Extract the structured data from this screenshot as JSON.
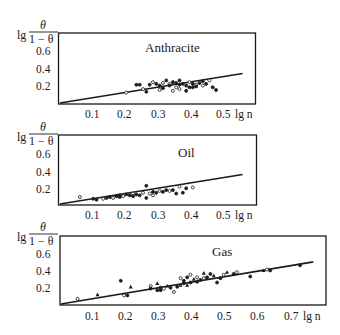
{
  "chart_data": [
    {
      "type": "scatter",
      "title": "Anthracite",
      "xlabel": "lg n",
      "ylabel": "lg θ/(1−θ)",
      "x_ticks": [
        "0.1",
        "0.2",
        "0.3",
        "0.4",
        "0.5"
      ],
      "y_ticks": [
        "0.2",
        "0.4",
        "0.6"
      ],
      "xlim": [
        0,
        0.59
      ],
      "ylim": [
        0,
        0.8
      ],
      "grid": false,
      "fit_line": {
        "x": [
          0,
          0.55
        ],
        "y": [
          0,
          0.34
        ]
      },
      "points": [
        [
          0.2,
          0.12
        ],
        [
          0.23,
          0.21
        ],
        [
          0.24,
          0.21
        ],
        [
          0.25,
          0.16
        ],
        [
          0.26,
          0.13
        ],
        [
          0.27,
          0.21
        ],
        [
          0.28,
          0.24
        ],
        [
          0.29,
          0.22
        ],
        [
          0.3,
          0.2
        ],
        [
          0.31,
          0.23
        ],
        [
          0.31,
          0.17
        ],
        [
          0.32,
          0.26
        ],
        [
          0.33,
          0.22
        ],
        [
          0.33,
          0.2
        ],
        [
          0.34,
          0.24
        ],
        [
          0.35,
          0.18
        ],
        [
          0.35,
          0.23
        ],
        [
          0.36,
          0.21
        ],
        [
          0.36,
          0.16
        ],
        [
          0.37,
          0.22
        ],
        [
          0.38,
          0.2
        ],
        [
          0.39,
          0.24
        ],
        [
          0.39,
          0.18
        ],
        [
          0.4,
          0.22
        ],
        [
          0.41,
          0.21
        ],
        [
          0.41,
          0.19
        ],
        [
          0.42,
          0.23
        ],
        [
          0.43,
          0.2
        ],
        [
          0.43,
          0.25
        ],
        [
          0.44,
          0.22
        ],
        [
          0.45,
          0.26
        ],
        [
          0.46,
          0.18
        ],
        [
          0.47,
          0.15
        ],
        [
          0.34,
          0.14
        ],
        [
          0.38,
          0.14
        ],
        [
          0.36,
          0.26
        ],
        [
          0.3,
          0.15
        ],
        [
          0.4,
          0.18
        ]
      ]
    },
    {
      "type": "scatter",
      "title": "Oil",
      "xlabel": "lg n",
      "ylabel": "lg θ/(1−θ)",
      "x_ticks": [
        "0.1",
        "0.2",
        "0.3",
        "0.4",
        "0.5"
      ],
      "y_ticks": [
        "0.2",
        "0.4",
        "0.6"
      ],
      "xlim": [
        0,
        0.59
      ],
      "ylim": [
        0,
        0.8
      ],
      "grid": false,
      "fit_line": {
        "x": [
          0,
          0.55
        ],
        "y": [
          0,
          0.34
        ]
      },
      "points": [
        [
          0.06,
          0.08
        ],
        [
          0.1,
          0.06
        ],
        [
          0.11,
          0.05
        ],
        [
          0.13,
          0.06
        ],
        [
          0.14,
          0.07
        ],
        [
          0.15,
          0.08
        ],
        [
          0.16,
          0.07
        ],
        [
          0.17,
          0.09
        ],
        [
          0.18,
          0.1
        ],
        [
          0.19,
          0.09
        ],
        [
          0.2,
          0.11
        ],
        [
          0.21,
          0.1
        ],
        [
          0.22,
          0.12
        ],
        [
          0.23,
          0.11
        ],
        [
          0.24,
          0.1
        ],
        [
          0.25,
          0.13
        ],
        [
          0.26,
          0.21
        ],
        [
          0.26,
          0.07
        ],
        [
          0.27,
          0.12
        ],
        [
          0.28,
          0.14
        ],
        [
          0.29,
          0.13
        ],
        [
          0.3,
          0.15
        ],
        [
          0.31,
          0.14
        ],
        [
          0.32,
          0.16
        ],
        [
          0.33,
          0.15
        ],
        [
          0.34,
          0.16
        ],
        [
          0.35,
          0.12
        ],
        [
          0.36,
          0.2
        ],
        [
          0.37,
          0.13
        ],
        [
          0.38,
          0.18
        ],
        [
          0.4,
          0.19
        ],
        [
          0.18,
          0.08
        ],
        [
          0.22,
          0.09
        ],
        [
          0.28,
          0.1
        ]
      ]
    },
    {
      "type": "scatter",
      "title": "Gas",
      "xlabel": "lg n",
      "ylabel": "lg θ/(1−θ)",
      "x_ticks": [
        "0.1",
        "0.2",
        "0.3",
        "0.4",
        "0.5",
        "0.6",
        "0.7"
      ],
      "y_ticks": [
        "0.2",
        "0.4",
        "0.6"
      ],
      "xlim": [
        0,
        0.79
      ],
      "ylim": [
        0,
        0.8
      ],
      "grid": false,
      "fit_line": {
        "x": [
          0,
          0.76
        ],
        "y": [
          0,
          0.49
        ]
      },
      "points": [
        [
          0.05,
          0.06
        ],
        [
          0.11,
          0.11
        ],
        [
          0.18,
          0.27
        ],
        [
          0.19,
          0.1
        ],
        [
          0.2,
          0.1
        ],
        [
          0.21,
          0.2
        ],
        [
          0.27,
          0.21
        ],
        [
          0.27,
          0.18
        ],
        [
          0.29,
          0.16
        ],
        [
          0.29,
          0.24
        ],
        [
          0.3,
          0.16
        ],
        [
          0.3,
          0.19
        ],
        [
          0.31,
          0.18
        ],
        [
          0.32,
          0.21
        ],
        [
          0.33,
          0.19
        ],
        [
          0.34,
          0.14
        ],
        [
          0.35,
          0.2
        ],
        [
          0.36,
          0.22
        ],
        [
          0.36,
          0.3
        ],
        [
          0.37,
          0.24
        ],
        [
          0.37,
          0.27
        ],
        [
          0.38,
          0.22
        ],
        [
          0.38,
          0.31
        ],
        [
          0.39,
          0.25
        ],
        [
          0.39,
          0.34
        ],
        [
          0.4,
          0.29
        ],
        [
          0.41,
          0.26
        ],
        [
          0.41,
          0.31
        ],
        [
          0.42,
          0.28
        ],
        [
          0.43,
          0.36
        ],
        [
          0.43,
          0.3
        ],
        [
          0.44,
          0.31
        ],
        [
          0.45,
          0.35
        ],
        [
          0.46,
          0.33
        ],
        [
          0.47,
          0.25
        ],
        [
          0.48,
          0.3
        ],
        [
          0.49,
          0.34
        ],
        [
          0.5,
          0.37
        ],
        [
          0.52,
          0.35
        ],
        [
          0.53,
          0.37
        ],
        [
          0.57,
          0.32
        ],
        [
          0.61,
          0.39
        ],
        [
          0.62,
          0.4
        ],
        [
          0.63,
          0.39
        ],
        [
          0.72,
          0.45
        ]
      ]
    }
  ],
  "panels": [
    {
      "title": "Anthracite",
      "xlabel": "lg n",
      "ylabel_prefix": "lg",
      "ylabel_num": "θ",
      "ylabel_den": "1 − θ",
      "xticks": [
        "0.1",
        "0.2",
        "0.3",
        "0.4",
        "0.5"
      ],
      "yticks": [
        "0.6",
        "0.4",
        "0.2"
      ]
    },
    {
      "title": "Oil",
      "xlabel": "lg n",
      "ylabel_prefix": "lg",
      "ylabel_num": "θ",
      "ylabel_den": "1 − θ",
      "xticks": [
        "0.1",
        "0.2",
        "0.3",
        "0.4",
        "0.5"
      ],
      "yticks": [
        "0.6",
        "0.4",
        "0.2"
      ]
    },
    {
      "title": "Gas",
      "xlabel": "lg n",
      "ylabel_prefix": "lg",
      "ylabel_num": "θ",
      "ylabel_den": "1 − θ",
      "xticks": [
        "0.1",
        "0.2",
        "0.3",
        "0.4",
        "0.5",
        "0.6",
        "0.7"
      ],
      "yticks": [
        "0.6",
        "0.4",
        "0.2"
      ]
    }
  ],
  "colors": {
    "ink": "#1a1a1a",
    "background": "#ffffff"
  }
}
